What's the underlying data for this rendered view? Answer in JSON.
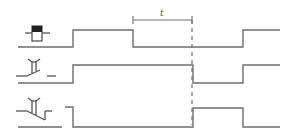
{
  "diagram": {
    "title": "",
    "dimension_label": "t",
    "colors": {
      "line": "#6e6e6e",
      "symbol": "#555555",
      "background": "#ffffff"
    },
    "rows": [
      {
        "id": "coil",
        "symbol": "relay-coil-icon",
        "description": "Relay coil input signal"
      },
      {
        "id": "no_contact",
        "symbol": "delayed-normally-open-contact-icon",
        "description": "Off-delay normally-open contact"
      },
      {
        "id": "nc_contact",
        "symbol": "delayed-normally-closed-contact-icon",
        "description": "Off-delay normally-closed contact"
      }
    ]
  }
}
